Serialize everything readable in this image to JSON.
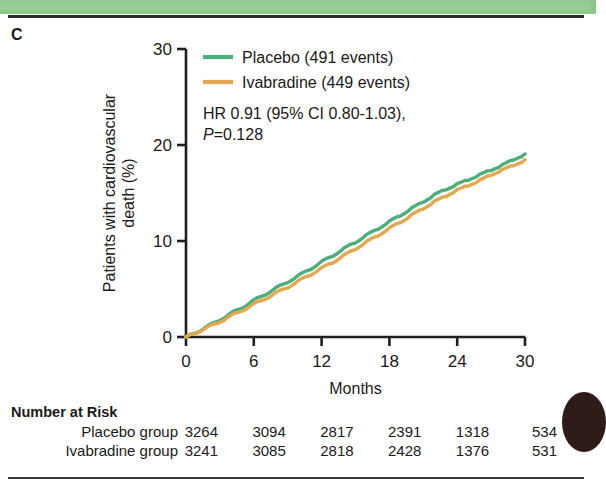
{
  "panel": {
    "label": "C"
  },
  "chart_data": {
    "type": "line",
    "title": "",
    "xlabel": "Months",
    "ylabel": "Patients with cardiovascular death (%)",
    "ylabel_line1": "Patients with cardiovascular",
    "ylabel_line2": "death (%)",
    "xlim": [
      0,
      30
    ],
    "ylim": [
      0,
      30
    ],
    "xticks": [
      0,
      6,
      12,
      18,
      24,
      30
    ],
    "yticks": [
      0,
      10,
      20,
      30
    ],
    "grid": false,
    "legend_position": "top-right",
    "annotation_line1": "HR 0.91 (95% CI 0.80-1.03),",
    "annotation_line2_prefix": "P",
    "annotation_line2_rest": "=0.128",
    "series": [
      {
        "name": "Placebo (491 events)",
        "short_name": "Placebo",
        "events": 491,
        "color": "#4CAE7C",
        "x": [
          0,
          1,
          2,
          3,
          4,
          5,
          6,
          7,
          8,
          9,
          10,
          11,
          12,
          13,
          14,
          15,
          16,
          17,
          18,
          19,
          20,
          21,
          22,
          23,
          24,
          25,
          26,
          27,
          28,
          29,
          30
        ],
        "values": [
          0,
          0.55,
          1.15,
          1.8,
          2.45,
          3.1,
          3.8,
          4.45,
          5.1,
          5.75,
          6.4,
          7.1,
          7.8,
          8.5,
          9.2,
          9.9,
          10.6,
          11.3,
          12.0,
          12.7,
          13.4,
          14.1,
          14.8,
          15.4,
          15.9,
          16.4,
          16.9,
          17.4,
          17.9,
          18.5,
          19.0
        ]
      },
      {
        "name": "Ivabradine (449 events)",
        "short_name": "Ivabradine",
        "events": 449,
        "color": "#E5A74E",
        "x": [
          0,
          1,
          2,
          3,
          4,
          5,
          6,
          7,
          8,
          9,
          10,
          11,
          12,
          13,
          14,
          15,
          16,
          17,
          18,
          19,
          20,
          21,
          22,
          23,
          24,
          25,
          26,
          27,
          28,
          29,
          30
        ],
        "values": [
          0,
          0.5,
          1.05,
          1.6,
          2.2,
          2.8,
          3.4,
          4.0,
          4.6,
          5.2,
          5.85,
          6.5,
          7.15,
          7.8,
          8.5,
          9.2,
          9.9,
          10.6,
          11.3,
          12.0,
          12.7,
          13.4,
          14.1,
          14.7,
          15.3,
          15.8,
          16.3,
          16.9,
          17.4,
          17.9,
          18.4
        ]
      }
    ]
  },
  "risk_table": {
    "title": "Number at Risk",
    "columns": [
      0,
      6,
      12,
      18,
      24,
      30
    ],
    "rows": [
      {
        "label": "Placebo group",
        "values": [
          "3264",
          "3094",
          "2817",
          "2391",
          "1318",
          "534"
        ]
      },
      {
        "label": "Ivabradine group",
        "values": [
          "3241",
          "3085",
          "2818",
          "2428",
          "1376",
          "531"
        ]
      }
    ]
  },
  "colors": {
    "placebo": "#4CAE7C",
    "ivabradine": "#E5A74E",
    "axis": "#1f1f1f",
    "band": "#8cc78c"
  }
}
